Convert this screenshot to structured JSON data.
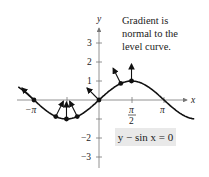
{
  "note": {
    "lines": [
      "Gradient is",
      "normal to the",
      "level curve."
    ]
  },
  "equation": "y − sin x = 0",
  "axes": {
    "x_label": "x",
    "y_label": "y",
    "x_ticks": [
      "−π",
      "π/2",
      "π"
    ],
    "y_ticks": [
      "3",
      "2",
      "1",
      "−2",
      "−3"
    ]
  },
  "chart_data": {
    "type": "line",
    "title": "Gradient is normal to the level curve.",
    "curve": "y - sin x = 0",
    "xlabel": "x",
    "ylabel": "y",
    "xlim": [
      -3.8,
      4.8
    ],
    "ylim": [
      -3.6,
      4
    ],
    "x_ticks": [
      "-π",
      "π/2",
      "π"
    ],
    "y_ticks": [
      -3,
      -2,
      -1,
      1,
      2,
      3
    ],
    "gradient_points": [
      {
        "x": -3.1416,
        "y": 0,
        "grad": [
          -1,
          1
        ]
      },
      {
        "x": -2.09,
        "y": -0.87,
        "grad": [
          0.5,
          1
        ]
      },
      {
        "x": -1.5708,
        "y": -1,
        "grad": [
          0,
          1
        ]
      },
      {
        "x": -1.05,
        "y": -0.87,
        "grad": [
          -0.5,
          1
        ]
      },
      {
        "x": 0,
        "y": 0,
        "grad": [
          -1,
          1
        ]
      },
      {
        "x": 1.05,
        "y": 0.87,
        "grad": [
          -0.5,
          1
        ]
      },
      {
        "x": 1.5708,
        "y": 1,
        "grad": [
          0,
          1
        ]
      }
    ]
  }
}
